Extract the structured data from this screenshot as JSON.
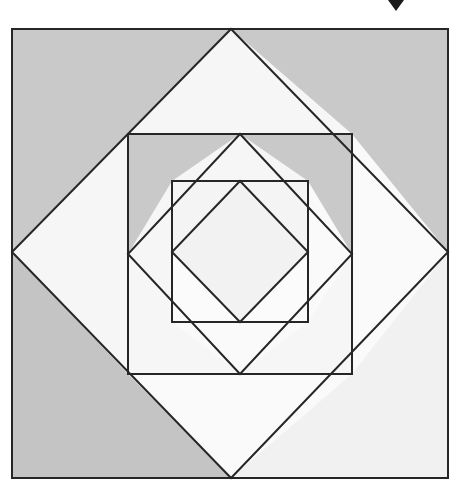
{
  "image": {
    "title": "Nested squares and inscribed diamonds geometric figure",
    "width": 467,
    "height": 504,
    "background_color": "#ffffff",
    "description": "A recursive geometric tiling: an outer square with an inscribed diamond, repeated at successively smaller, rotated scales, the triangular regions alternately shaded gray and near-white."
  },
  "palette": {
    "stroke": "#262626",
    "gray_fill": "#c9c9c9",
    "gray_fill_alt": "#c4c4c4",
    "light_fill": "#f1f1f1",
    "white_fill": "#fafafa",
    "bright_fill": "#f6f6f6",
    "marker_color": "#1a1a1a",
    "background": "#ffffff"
  },
  "geometry": {
    "stroke_width": 2,
    "levels": [
      {
        "name": "level-1-outer-square",
        "square": {
          "x1": 12,
          "y1": 29,
          "x2": 448,
          "y2": 478
        },
        "diamond": {
          "top": [
            231,
            29
          ],
          "right": [
            448,
            252
          ],
          "bottom": [
            231,
            478
          ],
          "left": [
            12,
            252
          ]
        }
      },
      {
        "name": "level-2-square",
        "square": {
          "x1": 128,
          "y1": 134,
          "x2": 352,
          "y2": 374
        },
        "diamond": {
          "top": [
            240,
            134
          ],
          "right": [
            352,
            254
          ],
          "bottom": [
            240,
            374
          ],
          "left": [
            128,
            254
          ]
        }
      },
      {
        "name": "level-3-square",
        "square": {
          "x1": 172,
          "y1": 181,
          "x2": 308,
          "y2": 322
        },
        "diamond": {
          "top": [
            240,
            181
          ],
          "right": [
            308,
            252
          ],
          "bottom": [
            240,
            322
          ],
          "left": [
            172,
            252
          ]
        }
      },
      {
        "name": "level-4-inner-diamond",
        "diamond": {
          "top": [
            240,
            181
          ],
          "right": [
            308,
            252
          ],
          "bottom": [
            240,
            322
          ],
          "left": [
            172,
            252
          ]
        }
      }
    ],
    "corner_triangles_level_1": [
      {
        "name": "top-left",
        "fill": "gray_fill",
        "points": "12,29 231,29 12,252"
      },
      {
        "name": "top-right",
        "fill": "gray_fill",
        "points": "231,29 448,29 448,252"
      },
      {
        "name": "bottom-left",
        "fill": "gray_fill_alt",
        "points": "12,252 231,478 12,478"
      },
      {
        "name": "bottom-right",
        "fill": "light_fill",
        "points": "448,252 448,478 231,478"
      }
    ],
    "marker": {
      "name": "chevron-down-marker",
      "points": "388,0 404,0 396,11",
      "fill": "marker_color"
    }
  },
  "labels": {
    "figure_caption": ""
  }
}
